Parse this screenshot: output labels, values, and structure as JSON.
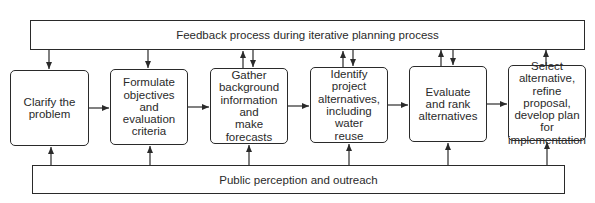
{
  "diagram": {
    "feedback_bar": {
      "label": "Feedback process during iterative planning process"
    },
    "outreach_bar": {
      "label": "Public perception and outreach"
    },
    "steps": [
      {
        "label": "Clarify the problem",
        "lines": [
          "Clarify the",
          "problem"
        ],
        "feedback": "down"
      },
      {
        "label": "Formulate objectives and evaluation criteria",
        "lines": [
          "Formulate",
          "objectives and",
          "evaluation",
          "criteria"
        ],
        "feedback": "down"
      },
      {
        "label": "Gather background information and make forecasts",
        "lines": [
          "Gather",
          "background",
          "information and",
          "make forecasts"
        ],
        "feedback": "both"
      },
      {
        "label": "Identify project alternatives, including water reuse",
        "lines": [
          "Identify project",
          "alternatives,",
          "including water",
          "reuse"
        ],
        "feedback": "both"
      },
      {
        "label": "Evaluate and rank alternatives",
        "lines": [
          "Evaluate",
          "and rank",
          "alternatives"
        ],
        "feedback": "both"
      },
      {
        "label": "Select alternative, refine proposal, develop plan for implementation",
        "lines": [
          "Select",
          "alternative,",
          "refine proposal,",
          "develop plan for",
          "implementation"
        ],
        "feedback": "up"
      }
    ]
  }
}
